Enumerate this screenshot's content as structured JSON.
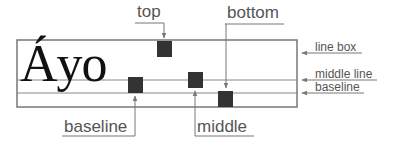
{
  "diagram": {
    "sample_text": "Áyo",
    "callouts_top": [
      {
        "label": "top"
      },
      {
        "label": "bottom"
      }
    ],
    "callouts_bottom": [
      {
        "label": "baseline"
      },
      {
        "label": "middle"
      }
    ],
    "side_labels": [
      {
        "label": "line box"
      },
      {
        "label": "middle line"
      },
      {
        "label": "baseline"
      }
    ],
    "colors": {
      "lines": "#777777",
      "squares": "#333333",
      "text": "#555555"
    }
  }
}
